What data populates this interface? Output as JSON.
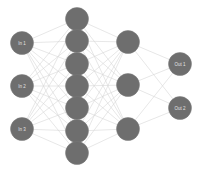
{
  "diagram": {
    "type": "feedforward-neural-network",
    "colors": {
      "node_fill": "#6e6e6e",
      "edge": "#d6d6d6",
      "label": "#e4e4e4",
      "background": "#ffffff"
    },
    "node_radius": 11.5,
    "layers": [
      {
        "name": "input",
        "x": 22,
        "nodes": [
          {
            "label": "In 1",
            "y": 43
          },
          {
            "label": "In 2",
            "y": 86
          },
          {
            "label": "In 3",
            "y": 129
          }
        ]
      },
      {
        "name": "hidden-1",
        "x": 77,
        "nodes": [
          {
            "label": "",
            "y": 19
          },
          {
            "label": "",
            "y": 41
          },
          {
            "label": "",
            "y": 64
          },
          {
            "label": "",
            "y": 86
          },
          {
            "label": "",
            "y": 108
          },
          {
            "label": "",
            "y": 131
          },
          {
            "label": "",
            "y": 153
          }
        ]
      },
      {
        "name": "hidden-2",
        "x": 128,
        "nodes": [
          {
            "label": "",
            "y": 42
          },
          {
            "label": "",
            "y": 85
          },
          {
            "label": "",
            "y": 129
          }
        ]
      },
      {
        "name": "output",
        "x": 180,
        "nodes": [
          {
            "label": "Out 1",
            "y": 64
          },
          {
            "label": "Out 2",
            "y": 108
          }
        ]
      }
    ],
    "connectivity": "fully-connected"
  }
}
